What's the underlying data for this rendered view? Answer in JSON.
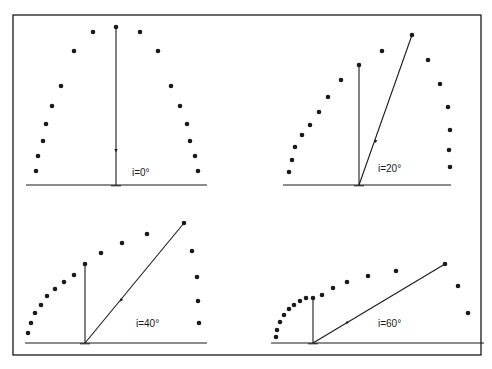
{
  "figure": {
    "frame": {
      "x": 13,
      "y": 15,
      "width": 468,
      "height": 340
    },
    "ink_color": "#1a1a1a",
    "background": "#ffffff",
    "panels": [
      {
        "id": "panel-0",
        "label": "i=0°",
        "label_pos": [
          132,
          176
        ],
        "baseline": {
          "x1": 26,
          "x2": 207,
          "y": 185
        },
        "foot": [
          116,
          185
        ],
        "normal_top": [
          116,
          27
        ],
        "incident_top": [
          116,
          27
        ],
        "arrow_mid": [
          116,
          149
        ],
        "dots": [
          [
            116,
            27
          ],
          [
            93,
            32
          ],
          [
            74,
            51
          ],
          [
            61,
            86
          ],
          [
            52,
            106
          ],
          [
            46,
            124
          ],
          [
            43,
            141
          ],
          [
            38,
            156
          ],
          [
            36,
            171
          ],
          [
            140,
            32
          ],
          [
            158,
            51
          ],
          [
            171,
            86
          ],
          [
            180,
            106
          ],
          [
            187,
            124
          ],
          [
            190,
            141
          ],
          [
            195,
            156
          ],
          [
            198,
            171
          ]
        ]
      },
      {
        "id": "panel-20",
        "label": "i=20°",
        "label_pos": [
          378,
          172
        ],
        "baseline": {
          "x1": 283,
          "x2": 451,
          "y": 185
        },
        "foot": [
          359,
          185
        ],
        "normal_top": [
          359,
          65
        ],
        "incident_top": [
          412,
          35
        ],
        "arrow_mid": [
          376,
          140
        ],
        "dots": [
          [
            359,
            65
          ],
          [
            412,
            35
          ],
          [
            289,
            172
          ],
          [
            292,
            160
          ],
          [
            295,
            147
          ],
          [
            302,
            135
          ],
          [
            310,
            125
          ],
          [
            319,
            112
          ],
          [
            328,
            97
          ],
          [
            341,
            80
          ],
          [
            382,
            51
          ],
          [
            428,
            60
          ],
          [
            440,
            84
          ],
          [
            448,
            107
          ],
          [
            450,
            130
          ],
          [
            449,
            150
          ],
          [
            450,
            167
          ]
        ]
      },
      {
        "id": "panel-40",
        "label": "i=40°",
        "label_pos": [
          136,
          327
        ],
        "baseline": {
          "x1": 25,
          "x2": 207,
          "y": 343
        },
        "foot": [
          85,
          343
        ],
        "normal_top": [
          85,
          264
        ],
        "incident_top": [
          184,
          223
        ],
        "arrow_mid": [
          122,
          299
        ],
        "dots": [
          [
            85,
            264
          ],
          [
            184,
            223
          ],
          [
            28,
            333
          ],
          [
            31,
            323
          ],
          [
            35,
            313
          ],
          [
            41,
            305
          ],
          [
            47,
            296
          ],
          [
            55,
            289
          ],
          [
            64,
            282
          ],
          [
            74,
            275
          ],
          [
            101,
            253
          ],
          [
            122,
            243
          ],
          [
            147,
            234
          ],
          [
            192,
            251
          ],
          [
            197,
            277
          ],
          [
            198,
            301
          ],
          [
            199,
            323
          ]
        ]
      },
      {
        "id": "panel-60",
        "label": "i=60°",
        "label_pos": [
          378,
          327
        ],
        "baseline": {
          "x1": 271,
          "x2": 484,
          "y": 343
        },
        "foot": [
          313,
          343
        ],
        "normal_top": [
          313,
          298
        ],
        "incident_top": [
          445,
          264
        ],
        "arrow_mid": [
          348,
          322
        ],
        "dots": [
          [
            313,
            298
          ],
          [
            445,
            264
          ],
          [
            276,
            337
          ],
          [
            277,
            330
          ],
          [
            280,
            322
          ],
          [
            284,
            315
          ],
          [
            289,
            309
          ],
          [
            294,
            305
          ],
          [
            300,
            301
          ],
          [
            306,
            298
          ],
          [
            322,
            295
          ],
          [
            333,
            288
          ],
          [
            347,
            282
          ],
          [
            368,
            276
          ],
          [
            396,
            271
          ],
          [
            458,
            286
          ],
          [
            468,
            313
          ]
        ]
      }
    ]
  }
}
